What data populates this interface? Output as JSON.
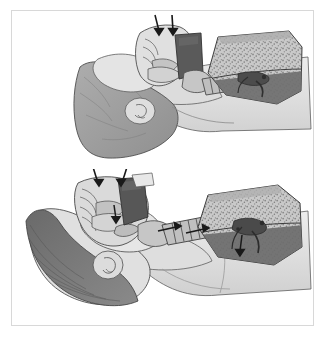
{
  "figure": {
    "type": "medical-illustration",
    "modality": "grayscale line drawing with tonal shading",
    "title": "Upper airway and lungs — two-panel comparison",
    "frame": {
      "border_color": "#d8d8d8",
      "background_color": "#ffffff",
      "left": 11,
      "top": 10,
      "width": 303,
      "height": 316
    },
    "panel_count": 2,
    "labels_present": false,
    "caption_text": ""
  },
  "palette": {
    "background": "#ffffff",
    "outline": "#3a3a3a",
    "skin_light": "#e2e2e2",
    "skin_mid": "#cfcfcf",
    "tissue_mid": "#b4b4b4",
    "muscle_gray": "#9a9a9a",
    "hair_dark": "#6f6f6f",
    "hair_darker": "#5e5e5e",
    "cavity_dark": "#585858",
    "cavity_darkest": "#4a4a4a",
    "lung_fill": "#c8c8c8",
    "lung_stipple": "#8a8a8a",
    "lung_lower_lobe": "#6d6d6d",
    "trachea_fill": "#c2c2c2",
    "trachea_ring": "#4f4f4f",
    "arrow_black": "#1a1a1a"
  },
  "panels": [
    {
      "id": "panel-top",
      "name": "upper-panel",
      "position": "top",
      "view": "midsagittal section of head, neck and right lung",
      "description": "Sagittal cut-away of the head and neck with the pharynx, larynx and trachea continuing to a sectioned lung. Two short arrows enter at the nose and mouth.",
      "anatomy": [
        {
          "key": "head-section",
          "label": "Sectioned head and face"
        },
        {
          "key": "nasal-cavity",
          "label": "Nasal cavity"
        },
        {
          "key": "oral-cavity",
          "label": "Oral cavity / tongue"
        },
        {
          "key": "soft-palate",
          "label": "Soft palate"
        },
        {
          "key": "pharynx",
          "label": "Pharynx"
        },
        {
          "key": "epiglottis",
          "label": "Epiglottis"
        },
        {
          "key": "larynx",
          "label": "Larynx"
        },
        {
          "key": "trachea",
          "label": "Trachea"
        },
        {
          "key": "bronchi",
          "label": "Main bronchi"
        },
        {
          "key": "lung",
          "label": "Lung (sectioned)"
        },
        {
          "key": "ear",
          "label": "External ear"
        },
        {
          "key": "shoulder",
          "label": "Shoulder / chest wall"
        }
      ],
      "arrows": [
        {
          "key": "arrow-nose-top",
          "direction": "down-into-nostril"
        },
        {
          "key": "arrow-mouth-top",
          "direction": "down-into-mouth"
        }
      ]
    },
    {
      "id": "panel-bottom",
      "name": "lower-panel",
      "position": "bottom",
      "view": "lateral head with hair, neck airway and right lung",
      "description": "Head shown in profile with hair, ear and sectioned airway. Arrows mark airflow down the pharynx and along the trachea toward the lung.",
      "anatomy": [
        {
          "key": "head-profile",
          "label": "Head in profile with hair"
        },
        {
          "key": "hair",
          "label": "Hair"
        },
        {
          "key": "ear",
          "label": "External ear"
        },
        {
          "key": "nasal-cavity",
          "label": "Nasal cavity"
        },
        {
          "key": "oral-cavity",
          "label": "Oral cavity / tongue"
        },
        {
          "key": "pharynx",
          "label": "Pharynx"
        },
        {
          "key": "larynx",
          "label": "Larynx"
        },
        {
          "key": "trachea",
          "label": "Trachea"
        },
        {
          "key": "bronchi",
          "label": "Main bronchi"
        },
        {
          "key": "lung",
          "label": "Lung (sectioned)"
        },
        {
          "key": "shoulder",
          "label": "Shoulder / chest wall"
        }
      ],
      "arrows": [
        {
          "key": "arrow-nose-bottom",
          "direction": "down-into-nostril"
        },
        {
          "key": "arrow-mouth-bottom",
          "direction": "down-into-mouth"
        },
        {
          "key": "arrow-pharynx",
          "direction": "down-posterior-pharynx"
        },
        {
          "key": "arrow-trachea-upper",
          "direction": "right-toward-lung"
        },
        {
          "key": "arrow-trachea-lower",
          "direction": "right-toward-lung"
        },
        {
          "key": "arrow-bronchus",
          "direction": "down-into-lung"
        }
      ]
    }
  ]
}
